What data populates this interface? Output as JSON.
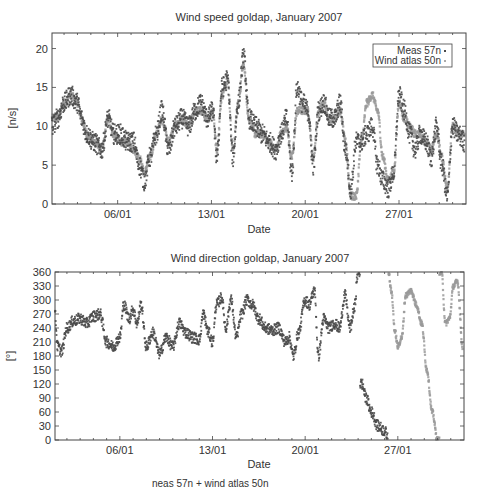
{
  "chart_data": [
    {
      "type": "scatter",
      "title": "Wind speed goldap, January 2007",
      "xlabel": "Date",
      "ylabel": "[n/s]",
      "xlim": [
        "01/01",
        "01/02"
      ],
      "ylim": [
        0,
        22
      ],
      "x_ticks": [
        "06/01",
        "13/01",
        "20/01",
        "27/01"
      ],
      "y_ticks": [
        0,
        5,
        10,
        15,
        20
      ],
      "grid": false,
      "legend_position": "top-right",
      "legend": [
        "Meas 57n",
        "Wind atlas 50n"
      ],
      "x_unit": "day of January 2007",
      "series": [
        {
          "name": "Meas 57n",
          "color": "#4a4a4a",
          "x": [
            1.1,
            1.5,
            2,
            2.5,
            3,
            3.3,
            3.7,
            4.2,
            4.8,
            5.3,
            5.7,
            6.2,
            6.7,
            7.2,
            7.6,
            8,
            8.4,
            8.9,
            9.3,
            9.8,
            10.3,
            10.8,
            11.3,
            11.8,
            12.2,
            12.7,
            13.1,
            13.4,
            13.8,
            14.2,
            14.6,
            15,
            15.4,
            15.8,
            16.3,
            16.8,
            17.3,
            17.8,
            18.2,
            18.6,
            19,
            19.4,
            19.8,
            20.2,
            20.6,
            21,
            21.4,
            21.8,
            22.2,
            22.6,
            23,
            23.4,
            23.8,
            24.2,
            24.6,
            25,
            25.4,
            25.8,
            26.2,
            26.6,
            27,
            27.4,
            27.8,
            28.2,
            28.6,
            29,
            29.4,
            29.8,
            30.2,
            30.6,
            31,
            31.4,
            31.9
          ],
          "y": [
            10,
            11,
            13,
            14,
            13,
            11,
            9,
            8,
            7,
            11,
            9,
            9,
            8,
            8,
            5,
            3,
            6,
            9,
            12,
            7,
            10,
            11,
            10,
            12,
            13,
            11,
            12,
            6,
            15,
            16,
            6,
            13,
            19,
            11,
            10,
            9,
            8,
            7,
            9,
            11,
            4,
            15,
            13,
            12,
            5,
            12,
            13,
            11,
            11,
            13,
            7,
            2,
            8,
            8,
            9,
            10,
            5,
            3,
            2,
            4,
            14,
            12,
            9,
            7,
            9,
            8,
            6,
            10,
            5,
            1,
            10,
            9,
            8
          ],
          "note": "approximate trace read from scatter cloud"
        },
        {
          "name": "Wind atlas 50n",
          "color": "#9a9a9a",
          "x": [
            1.1,
            1.5,
            2,
            2.5,
            3,
            3.3,
            3.7,
            4.2,
            4.8,
            5.3,
            5.7,
            6.2,
            6.7,
            7.2,
            7.6,
            8,
            8.4,
            8.9,
            9.3,
            9.8,
            10.3,
            10.8,
            11.3,
            11.8,
            12.2,
            12.7,
            13.1,
            13.4,
            13.8,
            14.2,
            14.6,
            15,
            15.4,
            15.8,
            16.3,
            16.8,
            17.3,
            17.8,
            18.2,
            18.6,
            19,
            19.4,
            19.8,
            20.2,
            20.6,
            21,
            21.4,
            21.8,
            22.2,
            22.6,
            23,
            23.4,
            23.8,
            24.2,
            24.6,
            25,
            25.4,
            25.8,
            26.2,
            26.6,
            27,
            27.4,
            27.8,
            28.2,
            28.6,
            29,
            29.4,
            29.8,
            30.2,
            30.6,
            31,
            31.4,
            31.9
          ],
          "y": [
            11,
            11,
            13,
            14,
            13,
            11,
            9,
            8,
            7,
            11,
            9,
            8,
            8,
            7,
            6,
            4,
            6,
            9,
            11,
            8,
            10,
            11,
            10,
            12,
            12,
            11,
            12,
            7,
            14,
            16,
            7,
            13,
            18,
            11,
            9,
            9,
            8,
            7,
            9,
            10,
            6,
            12,
            12,
            12,
            6,
            12,
            13,
            11,
            11,
            12,
            8,
            1,
            1,
            8,
            13,
            14,
            12,
            6,
            3,
            4,
            13,
            11,
            10,
            9,
            9,
            8,
            7,
            9,
            6,
            2,
            10,
            9,
            9
          ],
          "note": "approximate trace read from scatter cloud"
        }
      ]
    },
    {
      "type": "scatter",
      "title": "Wind direction goldap, January 2007",
      "xlabel": "Date",
      "ylabel": "[°]",
      "xlim": [
        "01/01",
        "01/02"
      ],
      "ylim": [
        0,
        360
      ],
      "x_ticks": [
        "06/01",
        "13/01",
        "20/01",
        "27/01"
      ],
      "y_ticks": [
        0,
        30,
        60,
        90,
        120,
        150,
        180,
        210,
        240,
        270,
        300,
        330,
        360
      ],
      "grid": false,
      "series": [
        {
          "name": "Meas 57n",
          "color": "#4a4a4a",
          "x": [
            1.1,
            1.3,
            1.6,
            2,
            2.5,
            3,
            3.5,
            4,
            4.5,
            5,
            5.5,
            6,
            6.3,
            6.7,
            7,
            7.3,
            7.6,
            8,
            8.5,
            9,
            9.5,
            10,
            10.5,
            11,
            11.5,
            12,
            12.3,
            12.7,
            13,
            13.3,
            13.7,
            14,
            14.4,
            14.8,
            15.2,
            15.6,
            16,
            16.5,
            17,
            17.5,
            18,
            18.5,
            18.8,
            19.1,
            19.5,
            20,
            20.3,
            20.7,
            21,
            21.4,
            21.8,
            22.2,
            22.6,
            23,
            23.4,
            23.7,
            24,
            24.3,
            24.6,
            25,
            25.5,
            26,
            26.3
          ],
          "y": [
            270,
            200,
            190,
            240,
            255,
            260,
            250,
            265,
            270,
            210,
            200,
            220,
            290,
            260,
            280,
            250,
            290,
            200,
            230,
            185,
            220,
            200,
            250,
            230,
            220,
            215,
            270,
            230,
            210,
            290,
            305,
            240,
            300,
            220,
            270,
            300,
            290,
            260,
            240,
            235,
            240,
            210,
            220,
            180,
            230,
            300,
            290,
            320,
            180,
            260,
            240,
            250,
            240,
            310,
            240,
            280,
            360,
            120,
            90,
            60,
            30,
            20,
            0
          ]
        },
        {
          "name": "Wind atlas 50n",
          "color": "#9a9a9a",
          "x": [
            26.3,
            26.5,
            26.8,
            27,
            27.3,
            27.6,
            28,
            28.4,
            28.8,
            29.2,
            29.6,
            30,
            30.3,
            30.6,
            30.9,
            31.2,
            31.5,
            31.9
          ],
          "y": [
            360,
            320,
            230,
            200,
            220,
            310,
            320,
            290,
            250,
            150,
            60,
            0,
            360,
            250,
            260,
            330,
            340,
            200
          ]
        }
      ]
    }
  ],
  "caption": "neas 57n + wind atlas 50n"
}
